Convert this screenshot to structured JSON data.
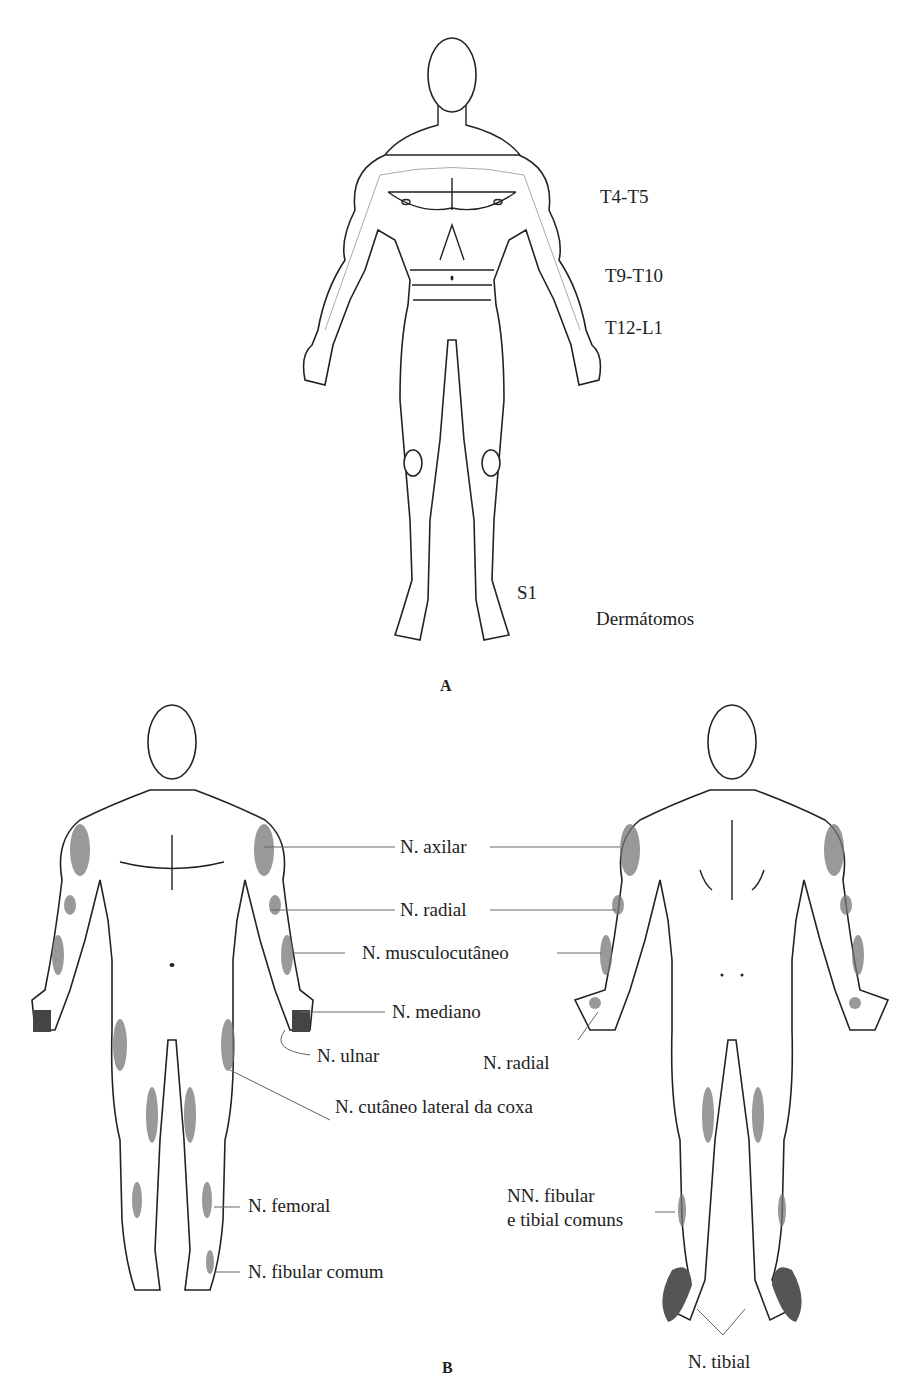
{
  "panel_a": {
    "label": "A",
    "title": "Dermátomos",
    "dermatomes": [
      "T4-T5",
      "T9-T10",
      "T12-L1",
      "S1"
    ]
  },
  "panel_b": {
    "label": "B",
    "nerves": {
      "axilar": "N. axilar",
      "radial": "N. radial",
      "musculocutaneo": "N. musculocutâneo",
      "mediano": "N. mediano",
      "ulnar": "N. ulnar",
      "radial_post": "N. radial",
      "cutaneo": "N. cutâneo lateral da coxa",
      "femoral": "N. femoral",
      "fibular": "N. fibular comum",
      "nn_fibular_1": "NN. fibular",
      "nn_fibular_2": "e tibial comuns",
      "tibial": "N. tibial"
    }
  }
}
